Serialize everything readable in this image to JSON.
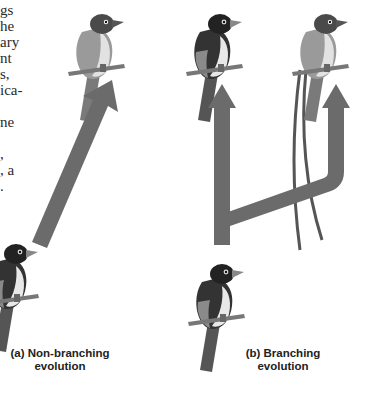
{
  "body_text_fragments": [
    "gs",
    "he",
    "ary",
    "nt",
    "s,",
    "ica-",
    "",
    "ne",
    "",
    ",",
    ", a",
    "."
  ],
  "panels": [
    {
      "id": "a",
      "caption_line1": "(a) Non-branching",
      "caption_line2": "evolution"
    },
    {
      "id": "b",
      "caption_line1": "(b) Branching",
      "caption_line2": "evolution"
    }
  ],
  "colors": {
    "arrow": "#6b6b6b",
    "bird_dark": "#2b2b2b",
    "bird_mid": "#8a8a8a",
    "bird_light": "#d4d4d4",
    "perch": "#777777"
  }
}
